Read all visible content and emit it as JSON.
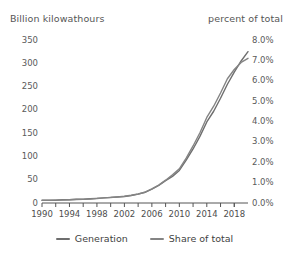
{
  "chart_data": {
    "type": "line",
    "title": "",
    "xlabel": "",
    "ylabel": "Billion kilowathours",
    "y2label": "percent of total",
    "grid": false,
    "legend_position": "bottom",
    "xlim": [
      1990,
      2020
    ],
    "ylim": [
      0,
      350
    ],
    "y2lim": [
      0.0,
      8.0
    ],
    "x_tick_labels": [
      "1990",
      "1994",
      "1998",
      "2002",
      "2006",
      "2010",
      "2014",
      "2018"
    ],
    "x_tick_values": [
      1990,
      1994,
      1998,
      2002,
      2006,
      2010,
      2014,
      2018
    ],
    "x_minor_ticks": [
      1992,
      1996,
      2000,
      2004,
      2008,
      2012,
      2016,
      2018
    ],
    "y_tick_labels": [
      "0",
      "50",
      "100",
      "150",
      "200",
      "250",
      "300",
      "350"
    ],
    "y_tick_values": [
      0,
      50,
      100,
      150,
      200,
      250,
      300,
      350
    ],
    "y2_tick_labels": [
      "0.0%",
      "1.0%",
      "2.0%",
      "3.0%",
      "4.0%",
      "5.0%",
      "6.0%",
      "7.0%",
      "8.0%"
    ],
    "y2_tick_values": [
      0.0,
      1.0,
      2.0,
      3.0,
      4.0,
      5.0,
      6.0,
      7.0,
      8.0
    ],
    "x": [
      1990,
      1991,
      1992,
      1993,
      1994,
      1995,
      1996,
      1997,
      1998,
      1999,
      2000,
      2001,
      2002,
      2003,
      2004,
      2005,
      2006,
      2007,
      2008,
      2009,
      2010,
      2011,
      2012,
      2013,
      2014,
      2015,
      2016,
      2017,
      2018,
      2019,
      2020
    ],
    "series": [
      {
        "name": "Generation",
        "axis": "left",
        "color": "#6e6e6e",
        "values": [
          6,
          6,
          6,
          7,
          7,
          8,
          8,
          9,
          10,
          11,
          12,
          13,
          14,
          16,
          19,
          23,
          30,
          38,
          48,
          57,
          70,
          92,
          116,
          143,
          174,
          197,
          225,
          255,
          281,
          305,
          325
        ]
      },
      {
        "name": "Share of total",
        "axis": "right",
        "color": "#848484",
        "values": [
          0.13,
          0.13,
          0.14,
          0.15,
          0.16,
          0.17,
          0.18,
          0.2,
          0.22,
          0.25,
          0.27,
          0.3,
          0.33,
          0.38,
          0.44,
          0.53,
          0.69,
          0.88,
          1.12,
          1.38,
          1.68,
          2.2,
          2.8,
          3.45,
          4.2,
          4.75,
          5.4,
          6.1,
          6.55,
          6.9,
          7.1
        ]
      }
    ]
  },
  "legend": {
    "items": [
      {
        "label": "Generation",
        "color": "#6e6e6e"
      },
      {
        "label": "Share of total",
        "color": "#848484"
      }
    ]
  },
  "axis_titles": {
    "left": "Billion kilowathours",
    "right": "percent of total"
  }
}
